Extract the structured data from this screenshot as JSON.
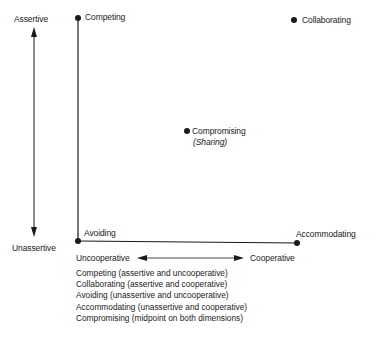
{
  "diagram": {
    "type": "conflict-modes-grid",
    "axes": {
      "vertical": {
        "top_label": "Assertive",
        "bottom_label": "Unassertive"
      },
      "horizontal": {
        "left_label": "Uncooperative",
        "right_label": "Cooperative"
      }
    },
    "points": [
      {
        "id": "competing",
        "label": "Competing",
        "sublabel": ""
      },
      {
        "id": "collaborating",
        "label": "Collaborating",
        "sublabel": ""
      },
      {
        "id": "compromising",
        "label": "Compromising",
        "sublabel": "(Sharing)"
      },
      {
        "id": "avoiding",
        "label": "Avoiding",
        "sublabel": ""
      },
      {
        "id": "accommodating",
        "label": "Accommodating",
        "sublabel": ""
      }
    ],
    "legend": [
      "Competing (assertive and uncooperative)",
      "Collaborating (assertive and cooperative)",
      "Avoiding (unassertive and uncooperative)",
      "Accommodating (unassertive and cooperative)",
      "Compromising (midpoint on both dimensions)"
    ],
    "colors": {
      "ink": "#1a1a1a",
      "background": "#ffffff"
    }
  }
}
